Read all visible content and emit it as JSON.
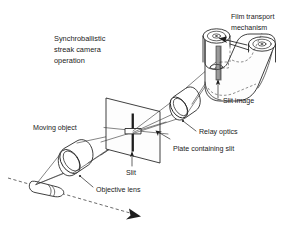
{
  "figure": {
    "title_lines": [
      "Synchroballistic",
      "streak camera",
      "operation"
    ],
    "background_color": "#ffffff",
    "line_color": "#1d1d1d",
    "slit_image_color": "#9a9a9a"
  },
  "labels": {
    "film_transport_line1": "Film transport",
    "film_transport_line2": "mechanism",
    "slit_image": "Slit image",
    "relay_optics": "Relay optics",
    "plate_containing_slit": "Plate containing slit",
    "moving_object": "Moving object",
    "slit": "Slit",
    "objective_lens": "Objective lens"
  },
  "components": [
    {
      "name": "moving-object",
      "label": "Moving object",
      "shape": "bullet-projectile",
      "description": "Projectile travelling along dashed trajectory at lower left"
    },
    {
      "name": "objective-lens",
      "label": "Objective lens",
      "shape": "cylinder-lens",
      "description": "Tilted lens barrel collecting light from the moving object"
    },
    {
      "name": "plate-containing-slit",
      "label": "Plate containing slit",
      "shape": "perspective-plate",
      "description": "Flat plate in perspective carrying the narrow slit aperture"
    },
    {
      "name": "slit",
      "label": "Slit",
      "shape": "vertical-bar",
      "description": "Narrow vertical opening at the centre of the plate"
    },
    {
      "name": "relay-optics",
      "label": "Relay optics",
      "shape": "cylinder-lens",
      "description": "Second lens relaying the slit image onto the moving film"
    },
    {
      "name": "film-transport-mechanism",
      "label": "Film transport mechanism",
      "shape": "twin-spool-film-loop",
      "description": "Two spools carrying a continuous film loop past the slit image"
    },
    {
      "name": "slit-image",
      "label": "Slit image",
      "shape": "vertical-strip",
      "description": "Grey strip projected onto the moving film"
    }
  ]
}
